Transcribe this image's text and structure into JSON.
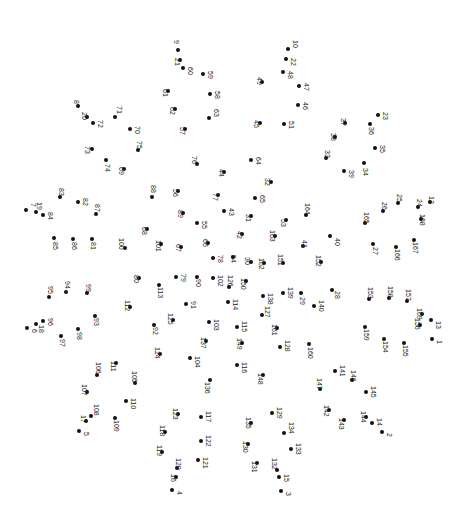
{
  "puzzle": {
    "type": "connect-the-dots",
    "dot_color": "#111111",
    "label_color": "#222222",
    "label_rotation_deg": 90,
    "dots": [
      {
        "n": "1",
        "x": 432,
        "y": 339,
        "lx": 436,
        "ly": 340
      },
      {
        "n": "2",
        "x": 382,
        "y": 432,
        "lx": 386,
        "ly": 433
      },
      {
        "n": "3",
        "x": 281,
        "y": 491,
        "lx": 285,
        "ly": 492
      },
      {
        "n": "4",
        "x": 172,
        "y": 490,
        "lx": 176,
        "ly": 491
      },
      {
        "n": "5",
        "x": 79,
        "y": 431,
        "lx": 83,
        "ly": 432
      },
      {
        "n": "6",
        "x": 27,
        "y": 328,
        "lx": 31,
        "ly": 329
      },
      {
        "n": "7",
        "x": 26,
        "y": 210,
        "lx": 30,
        "ly": 203
      },
      {
        "n": "8",
        "x": 78,
        "y": 106,
        "lx": 73,
        "ly": 100
      },
      {
        "n": "9",
        "x": 178,
        "y": 50,
        "lx": 173,
        "ly": 40
      },
      {
        "n": "10",
        "x": 288,
        "y": 49,
        "lx": 292,
        "ly": 40
      },
      {
        "n": "12",
        "x": 430,
        "y": 202,
        "lx": 428,
        "ly": 196
      },
      {
        "n": "13",
        "x": 431,
        "y": 320,
        "lx": 435,
        "ly": 321
      },
      {
        "n": "14",
        "x": 372,
        "y": 423,
        "lx": 376,
        "ly": 418
      },
      {
        "n": "15",
        "x": 279,
        "y": 477,
        "lx": 283,
        "ly": 474
      },
      {
        "n": "16",
        "x": 176,
        "y": 477,
        "lx": 170,
        "ly": 474
      },
      {
        "n": "17",
        "x": 86,
        "y": 421,
        "lx": 80,
        "ly": 415
      },
      {
        "n": "18",
        "x": 36,
        "y": 324,
        "lx": 38,
        "ly": 325
      },
      {
        "n": "19",
        "x": 36,
        "y": 212,
        "lx": 36,
        "ly": 202
      },
      {
        "n": "20",
        "x": 87,
        "y": 117,
        "lx": 81,
        "ly": 112
      },
      {
        "n": "21",
        "x": 180,
        "y": 60,
        "lx": 174,
        "ly": 58
      },
      {
        "n": "22",
        "x": 286,
        "y": 59,
        "lx": 290,
        "ly": 58
      },
      {
        "n": "23",
        "x": 378,
        "y": 115,
        "lx": 382,
        "ly": 112
      },
      {
        "n": "24",
        "x": 418,
        "y": 207,
        "lx": 416,
        "ly": 199
      },
      {
        "n": "25",
        "x": 398,
        "y": 203,
        "lx": 396,
        "ly": 194
      },
      {
        "n": "26",
        "x": 383,
        "y": 211,
        "lx": 381,
        "ly": 202
      },
      {
        "n": "27",
        "x": 373,
        "y": 244,
        "lx": 372,
        "ly": 247
      },
      {
        "n": "28",
        "x": 332,
        "y": 290,
        "lx": 334,
        "ly": 291
      },
      {
        "n": "29",
        "x": 301,
        "y": 293,
        "lx": 299,
        "ly": 297
      },
      {
        "n": "30",
        "x": 251,
        "y": 262,
        "lx": 244,
        "ly": 257
      },
      {
        "n": "31",
        "x": 251,
        "y": 216,
        "lx": 245,
        "ly": 214
      },
      {
        "n": "32",
        "x": 271,
        "y": 182,
        "lx": 264,
        "ly": 178
      },
      {
        "n": "33",
        "x": 326,
        "y": 158,
        "lx": 324,
        "ly": 150
      },
      {
        "n": "34",
        "x": 364,
        "y": 163,
        "lx": 362,
        "ly": 168
      },
      {
        "n": "35",
        "x": 375,
        "y": 148,
        "lx": 379,
        "ly": 145
      },
      {
        "n": "36",
        "x": 370,
        "y": 124,
        "lx": 368,
        "ly": 127
      },
      {
        "n": "37",
        "x": 345,
        "y": 123,
        "lx": 340,
        "ly": 118
      },
      {
        "n": "38",
        "x": 335,
        "y": 137,
        "lx": 330,
        "ly": 133
      },
      {
        "n": "39",
        "x": 344,
        "y": 171,
        "lx": 348,
        "ly": 170
      },
      {
        "n": "40",
        "x": 330,
        "y": 236,
        "lx": 334,
        "ly": 238
      },
      {
        "n": "41",
        "x": 303,
        "y": 246,
        "lx": 301,
        "ly": 240
      },
      {
        "n": "42",
        "x": 242,
        "y": 234,
        "lx": 236,
        "ly": 231
      },
      {
        "n": "43",
        "x": 224,
        "y": 211,
        "lx": 228,
        "ly": 208
      },
      {
        "n": "44",
        "x": 224,
        "y": 172,
        "lx": 218,
        "ly": 169
      },
      {
        "n": "45",
        "x": 260,
        "y": 123,
        "lx": 253,
        "ly": 120
      },
      {
        "n": "46",
        "x": 298,
        "y": 105,
        "lx": 302,
        "ly": 102
      },
      {
        "n": "47",
        "x": 299,
        "y": 86,
        "lx": 303,
        "ly": 83
      },
      {
        "n": "48",
        "x": 283,
        "y": 72,
        "lx": 287,
        "ly": 71
      },
      {
        "n": "49",
        "x": 262,
        "y": 82,
        "lx": 256,
        "ly": 77
      },
      {
        "n": "51",
        "x": 284,
        "y": 124,
        "lx": 288,
        "ly": 121
      },
      {
        "n": "53",
        "x": 286,
        "y": 220,
        "lx": 280,
        "ly": 219
      },
      {
        "n": "54",
        "x": 233,
        "y": 257,
        "lx": 230,
        "ly": 255
      },
      {
        "n": "55",
        "x": 197,
        "y": 223,
        "lx": 201,
        "ly": 221
      },
      {
        "n": "56",
        "x": 178,
        "y": 191,
        "lx": 172,
        "ly": 189
      },
      {
        "n": "57",
        "x": 185,
        "y": 129,
        "lx": 179,
        "ly": 127
      },
      {
        "n": "58",
        "x": 210,
        "y": 94,
        "lx": 214,
        "ly": 91
      },
      {
        "n": "59",
        "x": 203,
        "y": 74,
        "lx": 207,
        "ly": 71
      },
      {
        "n": "60",
        "x": 183,
        "y": 68,
        "lx": 187,
        "ly": 67
      },
      {
        "n": "61",
        "x": 168,
        "y": 91,
        "lx": 162,
        "ly": 89
      },
      {
        "n": "62",
        "x": 175,
        "y": 109,
        "lx": 169,
        "ly": 107
      },
      {
        "n": "63",
        "x": 209,
        "y": 118,
        "lx": 213,
        "ly": 109
      },
      {
        "n": "64",
        "x": 251,
        "y": 160,
        "lx": 255,
        "ly": 157
      },
      {
        "n": "65",
        "x": 255,
        "y": 198,
        "lx": 259,
        "ly": 195
      },
      {
        "n": "66",
        "x": 208,
        "y": 243,
        "lx": 202,
        "ly": 239
      },
      {
        "n": "67",
        "x": 181,
        "y": 247,
        "lx": 175,
        "ly": 244
      },
      {
        "n": "68",
        "x": 147,
        "y": 229,
        "lx": 141,
        "ly": 227
      },
      {
        "n": "69",
        "x": 124,
        "y": 169,
        "lx": 118,
        "ly": 167
      },
      {
        "n": "70",
        "x": 130,
        "y": 129,
        "lx": 134,
        "ly": 126
      },
      {
        "n": "71",
        "x": 115,
        "y": 117,
        "lx": 116,
        "ly": 106
      },
      {
        "n": "72",
        "x": 93,
        "y": 123,
        "lx": 97,
        "ly": 120
      },
      {
        "n": "73",
        "x": 92,
        "y": 149,
        "lx": 84,
        "ly": 146
      },
      {
        "n": "74",
        "x": 106,
        "y": 160,
        "lx": 104,
        "ly": 164
      },
      {
        "n": "75",
        "x": 138,
        "y": 150,
        "lx": 136,
        "ly": 141
      },
      {
        "n": "76",
        "x": 197,
        "y": 164,
        "lx": 191,
        "ly": 156
      },
      {
        "n": "77",
        "x": 218,
        "y": 195,
        "lx": 212,
        "ly": 193
      },
      {
        "n": "78",
        "x": 213,
        "y": 258,
        "lx": 217,
        "ly": 255
      },
      {
        "n": "79",
        "x": 176,
        "y": 277,
        "lx": 180,
        "ly": 274
      },
      {
        "n": "80",
        "x": 139,
        "y": 278,
        "lx": 133,
        "ly": 275
      },
      {
        "n": "81",
        "x": 92,
        "y": 239,
        "lx": 90,
        "ly": 242
      },
      {
        "n": "82",
        "x": 78,
        "y": 202,
        "lx": 82,
        "ly": 198
      },
      {
        "n": "83",
        "x": 60,
        "y": 197,
        "lx": 58,
        "ly": 188
      },
      {
        "n": "84",
        "x": 43,
        "y": 215,
        "lx": 47,
        "ly": 212
      },
      {
        "n": "85",
        "x": 54,
        "y": 238,
        "lx": 52,
        "ly": 242
      },
      {
        "n": "86",
        "x": 73,
        "y": 239,
        "lx": 71,
        "ly": 242
      },
      {
        "n": "87",
        "x": 96,
        "y": 214,
        "lx": 94,
        "ly": 204
      },
      {
        "n": "88",
        "x": 152,
        "y": 197,
        "lx": 150,
        "ly": 185
      },
      {
        "n": "89",
        "x": 183,
        "y": 213,
        "lx": 177,
        "ly": 210
      },
      {
        "n": "90",
        "x": 197,
        "y": 277,
        "lx": 195,
        "ly": 279
      },
      {
        "n": "91",
        "x": 186,
        "y": 304,
        "lx": 190,
        "ly": 301
      },
      {
        "n": "92",
        "x": 154,
        "y": 325,
        "lx": 152,
        "ly": 327
      },
      {
        "n": "93",
        "x": 95,
        "y": 316,
        "lx": 93,
        "ly": 318
      },
      {
        "n": "94",
        "x": 66,
        "y": 292,
        "lx": 64,
        "ly": 281
      },
      {
        "n": "95",
        "x": 49,
        "y": 297,
        "lx": 47,
        "ly": 286
      },
      {
        "n": "96",
        "x": 43,
        "y": 321,
        "lx": 47,
        "ly": 318
      },
      {
        "n": "97",
        "x": 61,
        "y": 336,
        "lx": 59,
        "ly": 339
      },
      {
        "n": "98",
        "x": 78,
        "y": 329,
        "lx": 76,
        "ly": 332
      },
      {
        "n": "99",
        "x": 87,
        "y": 293,
        "lx": 85,
        "ly": 284
      },
      {
        "n": "100",
        "x": 125,
        "y": 248,
        "lx": 118,
        "ly": 238
      },
      {
        "n": "101",
        "x": 161,
        "y": 244,
        "lx": 155,
        "ly": 240
      },
      {
        "n": "102",
        "x": 213,
        "y": 278,
        "lx": 217,
        "ly": 275
      },
      {
        "n": "103",
        "x": 209,
        "y": 322,
        "lx": 213,
        "ly": 319
      },
      {
        "n": "104",
        "x": 190,
        "y": 358,
        "lx": 194,
        "ly": 356
      },
      {
        "n": "105",
        "x": 135,
        "y": 383,
        "lx": 131,
        "ly": 371
      },
      {
        "n": "106",
        "x": 97,
        "y": 375,
        "lx": 95,
        "ly": 362
      },
      {
        "n": "107",
        "x": 87,
        "y": 392,
        "lx": 81,
        "ly": 384
      },
      {
        "n": "108",
        "x": 91,
        "y": 416,
        "lx": 93,
        "ly": 404
      },
      {
        "n": "109",
        "x": 115,
        "y": 418,
        "lx": 113,
        "ly": 420
      },
      {
        "n": "110",
        "x": 126,
        "y": 401,
        "lx": 130,
        "ly": 398
      },
      {
        "n": "111",
        "x": 116,
        "y": 363,
        "lx": 110,
        "ly": 361
      },
      {
        "n": "112",
        "x": 130,
        "y": 307,
        "lx": 124,
        "ly": 300
      },
      {
        "n": "113",
        "x": 159,
        "y": 285,
        "lx": 157,
        "ly": 287
      },
      {
        "n": "114",
        "x": 228,
        "y": 302,
        "lx": 232,
        "ly": 299
      },
      {
        "n": "115",
        "x": 237,
        "y": 327,
        "lx": 241,
        "ly": 321
      },
      {
        "n": "116",
        "x": 237,
        "y": 365,
        "lx": 241,
        "ly": 362
      },
      {
        "n": "117",
        "x": 201,
        "y": 417,
        "lx": 205,
        "ly": 411
      },
      {
        "n": "118",
        "x": 165,
        "y": 432,
        "lx": 159,
        "ly": 425
      },
      {
        "n": "119",
        "x": 162,
        "y": 452,
        "lx": 156,
        "ly": 445
      },
      {
        "n": "120",
        "x": 177,
        "y": 468,
        "lx": 175,
        "ly": 458
      },
      {
        "n": "121",
        "x": 198,
        "y": 460,
        "lx": 202,
        "ly": 457
      },
      {
        "n": "122",
        "x": 201,
        "y": 441,
        "lx": 205,
        "ly": 435
      },
      {
        "n": "123",
        "x": 178,
        "y": 414,
        "lx": 172,
        "ly": 408
      },
      {
        "n": "124",
        "x": 160,
        "y": 354,
        "lx": 154,
        "ly": 347
      },
      {
        "n": "125",
        "x": 173,
        "y": 320,
        "lx": 167,
        "ly": 313
      },
      {
        "n": "126",
        "x": 229,
        "y": 287,
        "lx": 227,
        "ly": 275
      },
      {
        "n": "127",
        "x": 262,
        "y": 315,
        "lx": 264,
        "ly": 306
      },
      {
        "n": "128",
        "x": 280,
        "y": 347,
        "lx": 284,
        "ly": 340
      },
      {
        "n": "129",
        "x": 272,
        "y": 413,
        "lx": 276,
        "ly": 407
      },
      {
        "n": "130",
        "x": 248,
        "y": 444,
        "lx": 242,
        "ly": 441
      },
      {
        "n": "131",
        "x": 257,
        "y": 463,
        "lx": 251,
        "ly": 461
      },
      {
        "n": "132",
        "x": 277,
        "y": 470,
        "lx": 271,
        "ly": 458
      },
      {
        "n": "133",
        "x": 291,
        "y": 449,
        "lx": 295,
        "ly": 443
      },
      {
        "n": "134",
        "x": 284,
        "y": 433,
        "lx": 288,
        "ly": 422
      },
      {
        "n": "135",
        "x": 251,
        "y": 423,
        "lx": 245,
        "ly": 417
      },
      {
        "n": "136",
        "x": 210,
        "y": 380,
        "lx": 204,
        "ly": 382
      },
      {
        "n": "137",
        "x": 206,
        "y": 341,
        "lx": 200,
        "ly": 337
      },
      {
        "n": "138",
        "x": 263,
        "y": 296,
        "lx": 267,
        "ly": 293
      },
      {
        "n": "139",
        "x": 283,
        "y": 293,
        "lx": 287,
        "ly": 287
      },
      {
        "n": "140",
        "x": 314,
        "y": 306,
        "lx": 318,
        "ly": 300
      },
      {
        "n": "141",
        "x": 335,
        "y": 371,
        "lx": 339,
        "ly": 365
      },
      {
        "n": "142",
        "x": 329,
        "y": 410,
        "lx": 323,
        "ly": 405
      },
      {
        "n": "143",
        "x": 344,
        "y": 420,
        "lx": 338,
        "ly": 418
      },
      {
        "n": "144",
        "x": 366,
        "y": 417,
        "lx": 360,
        "ly": 411
      },
      {
        "n": "145",
        "x": 366,
        "y": 392,
        "lx": 370,
        "ly": 386
      },
      {
        "n": "146",
        "x": 352,
        "y": 380,
        "lx": 350,
        "ly": 370
      },
      {
        "n": "147",
        "x": 320,
        "y": 389,
        "lx": 316,
        "ly": 378
      },
      {
        "n": "148",
        "x": 263,
        "y": 375,
        "lx": 257,
        "ly": 373
      },
      {
        "n": "149",
        "x": 242,
        "y": 343,
        "lx": 236,
        "ly": 338
      },
      {
        "n": "150",
        "x": 246,
        "y": 281,
        "lx": 240,
        "ly": 278
      },
      {
        "n": "151",
        "x": 283,
        "y": 263,
        "lx": 277,
        "ly": 254
      },
      {
        "n": "152",
        "x": 321,
        "y": 262,
        "lx": 315,
        "ly": 255
      },
      {
        "n": "153",
        "x": 369,
        "y": 299,
        "lx": 367,
        "ly": 287
      },
      {
        "n": "154",
        "x": 384,
        "y": 339,
        "lx": 382,
        "ly": 341
      },
      {
        "n": "155",
        "x": 404,
        "y": 343,
        "lx": 402,
        "ly": 345
      },
      {
        "n": "156",
        "x": 420,
        "y": 325,
        "lx": 414,
        "ly": 318
      },
      {
        "n": "157",
        "x": 407,
        "y": 301,
        "lx": 405,
        "ly": 289
      },
      {
        "n": "158",
        "x": 389,
        "y": 298,
        "lx": 387,
        "ly": 286
      },
      {
        "n": "159",
        "x": 365,
        "y": 327,
        "lx": 363,
        "ly": 329
      },
      {
        "n": "160",
        "x": 309,
        "y": 344,
        "lx": 307,
        "ly": 347
      },
      {
        "n": "161",
        "x": 277,
        "y": 328,
        "lx": 271,
        "ly": 324
      },
      {
        "n": "162",
        "x": 264,
        "y": 263,
        "lx": 258,
        "ly": 258
      },
      {
        "n": "163",
        "x": 275,
        "y": 236,
        "lx": 269,
        "ly": 230
      },
      {
        "n": "164",
        "x": 306,
        "y": 215,
        "lx": 304,
        "ly": 203
      },
      {
        "n": "165",
        "x": 365,
        "y": 223,
        "lx": 363,
        "ly": 212
      },
      {
        "n": "166",
        "x": 396,
        "y": 247,
        "lx": 394,
        "ly": 249
      },
      {
        "n": "167",
        "x": 414,
        "y": 240,
        "lx": 412,
        "ly": 242
      },
      {
        "n": "168",
        "x": 421,
        "y": 219,
        "lx": 419,
        "ly": 214
      },
      {
        "n": "169",
        "x": 422,
        "y": 314,
        "lx": 416,
        "ly": 308
      }
    ]
  }
}
